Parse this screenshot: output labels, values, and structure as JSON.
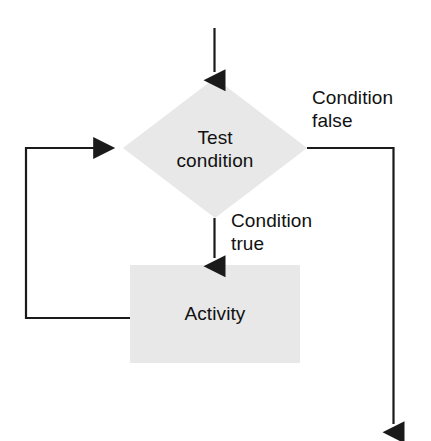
{
  "diagram": {
    "type": "flowchart",
    "background_color": "#ffffff",
    "shape_fill_color": "#e8e8e8",
    "line_color": "#1a1a1a",
    "text_color": "#111111",
    "nodes": [
      {
        "id": "test-condition",
        "shape": "diamond",
        "label": "Test\ncondition"
      },
      {
        "id": "activity",
        "shape": "rectangle",
        "label": "Activity"
      }
    ],
    "edges": [
      {
        "id": "entry",
        "from": "",
        "to": "test-condition",
        "label": ""
      },
      {
        "id": "true-branch",
        "from": "test-condition",
        "to": "activity",
        "label": "Condition\ntrue"
      },
      {
        "id": "false-branch",
        "from": "test-condition",
        "to": "",
        "label": "Condition\nfalse"
      },
      {
        "id": "loop-back",
        "from": "activity",
        "to": "test-condition",
        "label": ""
      }
    ]
  }
}
